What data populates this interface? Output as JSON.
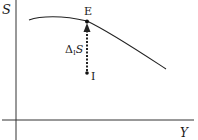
{
  "diagram": {
    "axes": {
      "y_label": "S",
      "x_label": "Y"
    },
    "points": {
      "E": "E",
      "I": "I"
    },
    "arrow": {
      "label_delta": "Δ",
      "label_sub": "I",
      "label_var": "S",
      "style": "dotted",
      "from": "I",
      "to": "E"
    },
    "curve": {
      "description": "concave curve rising slightly then declining through E"
    },
    "colors": {
      "stroke": "#1a1a1a",
      "background": "#ffffff"
    }
  }
}
